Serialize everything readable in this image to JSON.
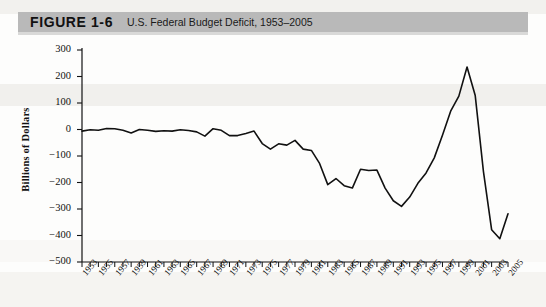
{
  "figure": {
    "label": "FIGURE 1-6",
    "title": "U.S. Federal Budget Deficit, 1953–2005"
  },
  "chart_data": {
    "type": "line",
    "title": "U.S. Federal Budget Deficit, 1953–2005",
    "xlabel": "",
    "ylabel": "Billions of Dollars",
    "ylim": [
      -500,
      300
    ],
    "xlim": [
      1953,
      2005
    ],
    "ytick_labels": [
      "300",
      "200",
      "100",
      "0",
      "−100",
      "−200",
      "−300",
      "−400",
      "−500"
    ],
    "ytick_values": [
      300,
      200,
      100,
      0,
      -100,
      -200,
      -300,
      -400,
      -500
    ],
    "xtick_labels": [
      "1953",
      "1955",
      "1957",
      "1959",
      "1961",
      "1963",
      "1965",
      "1967",
      "1969",
      "1971",
      "1973",
      "1975",
      "1977",
      "1979",
      "1981",
      "1983",
      "1985",
      "1987",
      "1989",
      "1991",
      "1993",
      "1995",
      "1997",
      "1999",
      "2001",
      "2003",
      "2005"
    ],
    "xtick_step_labeled": 2,
    "xtick_step_minor": 1,
    "grid": false,
    "legend": null,
    "line_color": "#111111",
    "x": [
      1953,
      1954,
      1955,
      1956,
      1957,
      1958,
      1959,
      1960,
      1961,
      1962,
      1963,
      1964,
      1965,
      1966,
      1967,
      1968,
      1969,
      1970,
      1971,
      1972,
      1973,
      1974,
      1975,
      1976,
      1977,
      1978,
      1979,
      1980,
      1981,
      1982,
      1983,
      1984,
      1985,
      1986,
      1987,
      1988,
      1989,
      1990,
      1991,
      1992,
      1993,
      1994,
      1995,
      1996,
      1997,
      1998,
      1999,
      2000,
      2001,
      2002,
      2003,
      2004,
      2005
    ],
    "values": [
      -6,
      -1,
      -3,
      4,
      3,
      -3,
      -13,
      0,
      -3,
      -7,
      -5,
      -6,
      -1,
      -4,
      -9,
      -25,
      3,
      -3,
      -23,
      -23,
      -15,
      -6,
      -53,
      -74,
      -54,
      -59,
      -41,
      -74,
      -79,
      -128,
      -208,
      -185,
      -212,
      -221,
      -150,
      -155,
      -153,
      -221,
      -269,
      -290,
      -255,
      -203,
      -164,
      -107,
      -22,
      69,
      126,
      236,
      128,
      -158,
      -378,
      -412,
      -318
    ],
    "annotations": []
  }
}
